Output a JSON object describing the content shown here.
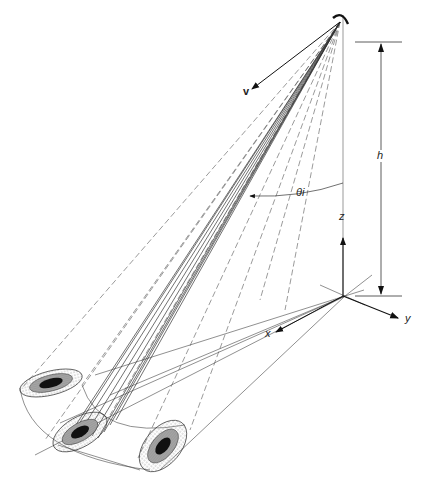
{
  "diagram": {
    "type": "radar-geometry-illustration",
    "labels": {
      "velocity": "v",
      "height": "h",
      "incidence_angle": "θi",
      "axis_x": "x",
      "axis_y": "y",
      "axis_z": "z"
    },
    "elements": [
      {
        "name": "antenna",
        "shape": "arc"
      },
      {
        "name": "velocity-vector",
        "label": "v"
      },
      {
        "name": "beam-fan",
        "style": "solid and dashed rays"
      },
      {
        "name": "footprint-ellipse-left",
        "rings": 3
      },
      {
        "name": "footprint-ellipse-center",
        "rings": 3
      },
      {
        "name": "footprint-ellipse-right",
        "rings": 3
      },
      {
        "name": "height-dimension",
        "label": "h"
      },
      {
        "name": "coordinate-axes",
        "labels": [
          "x",
          "y",
          "z"
        ]
      }
    ],
    "colors": {
      "line": "#333333",
      "stipple": "#9a9a9a",
      "core": "#111111"
    }
  }
}
